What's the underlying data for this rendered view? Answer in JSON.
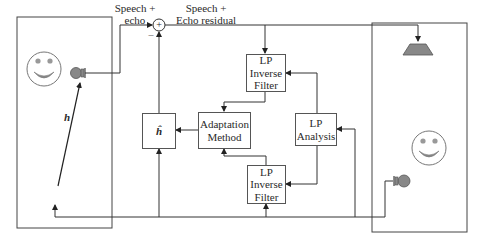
{
  "labels": {
    "speech_echo_line1": "Speech +",
    "speech_echo_line2": "echo",
    "speech_residual_line1": "Speech +",
    "speech_residual_line2": "Echo residual",
    "minus_sign": "–",
    "plus_sign": "+",
    "h_path": "h"
  },
  "blocks": {
    "lp_inverse_filter_top": {
      "line1": "LP",
      "line2": "Inverse",
      "line3": "Filter"
    },
    "adaptation_method": {
      "line1": "Adaptation",
      "line2": "Method"
    },
    "h_hat": {
      "label": "ĥ"
    },
    "lp_analysis": {
      "line1": "LP",
      "line2": "Analysis"
    },
    "lp_inverse_filter_bottom": {
      "line1": "LP",
      "line2": "Inverse",
      "line3": "Filter"
    }
  },
  "colors": {
    "line": "#333333",
    "box_border": "#555555",
    "device_fill": "#888888",
    "face_stroke": "#777777"
  }
}
